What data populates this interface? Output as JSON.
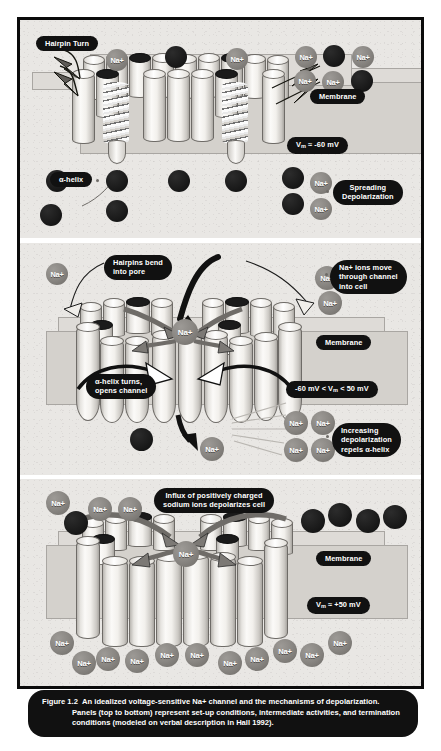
{
  "figure": {
    "caption_label": "Figure 1.2",
    "caption_title": "An idealized voltage-sensitive Na+ channel and the mechanisms of depolarization.",
    "caption_body": "Panels (top to bottom) represent set-up conditions, intermediate activities, and termination conditions (modeled on verbal description in Hall 1992)."
  },
  "ion_label": "Na+",
  "panels": [
    {
      "id": "panel-1",
      "name": "set-up-conditions",
      "labels": {
        "hairpin_turn": "Hairpin Turn",
        "membrane": "Membrane",
        "voltage": "Vm ≈ -60 mV",
        "voltage_prefix": "V",
        "voltage_sub": "m",
        "voltage_suffix": " ≈ -60 mV",
        "alpha_helix": "α-helix",
        "spreading_depolarization": "Spreading\nDepolarization"
      }
    },
    {
      "id": "panel-2",
      "name": "intermediate-activities",
      "labels": {
        "hairpins_bend": "Hairpins bend\ninto pore",
        "ions_move": "Na+ ions move\nthrough channel\ninto cell",
        "membrane": "Membrane",
        "voltage_prefix": "-60 mV < V",
        "voltage_sub": "m",
        "voltage_suffix": " < 50 mV",
        "alpha_helix_turns": "α-helix turns,\nopens channel",
        "increasing_depolarization": "Increasing\ndepolarization\nrepels α-helix"
      }
    },
    {
      "id": "panel-3",
      "name": "termination-conditions",
      "labels": {
        "influx": "Influx of positively charged\nsodium ions depolarizes cell",
        "membrane": "Membrane",
        "voltage_prefix": "V",
        "voltage_sub": "m",
        "voltage_suffix": " ≈ +50 mV"
      }
    }
  ],
  "colors": {
    "panel_background": "#e9e7e4",
    "frame": "#0b0b0b",
    "pill_background": "#111111",
    "pill_text": "#ffffff",
    "ion_sodium": "#8a8783",
    "ion_dark": "#1a1a1a",
    "membrane_slab": "#d4d1cc",
    "cylinder": "#f2f0ec"
  }
}
